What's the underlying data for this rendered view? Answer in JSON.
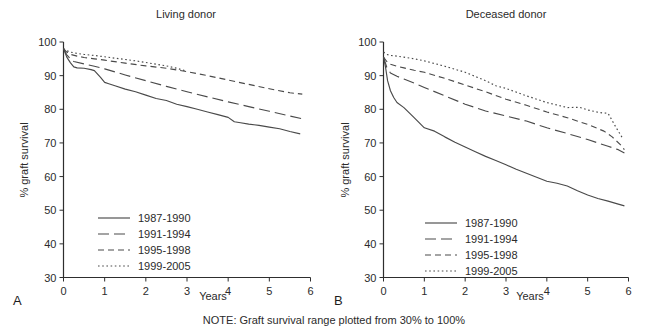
{
  "figure": {
    "note": "NOTE: Graft survival range plotted from 30% to 100%",
    "y_axis_title": "% graft survival",
    "x_axis_title": "Years"
  },
  "panels": [
    {
      "letter": "A",
      "title": "Living donor",
      "legend": [
        {
          "label": "1987-1990",
          "style": "solid"
        },
        {
          "label": "1991-1994",
          "style": "longdash"
        },
        {
          "label": "1995-1998",
          "style": "dash"
        },
        {
          "label": "1999-2005",
          "style": "dot"
        }
      ]
    },
    {
      "letter": "B",
      "title": "Deceased donor",
      "legend": [
        {
          "label": "1987-1990",
          "style": "solid"
        },
        {
          "label": "1991-1994",
          "style": "longdash"
        },
        {
          "label": "1995-1998",
          "style": "dash"
        },
        {
          "label": "1999-2005",
          "style": "dot"
        }
      ]
    }
  ],
  "axes": {
    "y_ticks": [
      "100",
      "90",
      "80",
      "70",
      "60",
      "50",
      "40",
      "30"
    ],
    "x_ticks": [
      "0",
      "1",
      "2",
      "3",
      "4",
      "5",
      "6"
    ]
  },
  "chart_data": {
    "type": "line",
    "subtitle": "NOTE: Graft survival range plotted from 30% to 100%",
    "xlabel": "Years",
    "ylabel": "% graft survival",
    "xlim": [
      0,
      6
    ],
    "ylim": [
      30,
      100
    ],
    "grid": false,
    "legend_position": "lower-left-inside",
    "panels": [
      {
        "panel": "A",
        "title": "Living donor",
        "series": [
          {
            "name": "1987-1990",
            "style": "solid",
            "x": [
              0,
              0.08,
              0.17,
              0.25,
              0.33,
              0.5,
              0.67,
              0.75,
              0.9,
              1.0,
              1.1,
              1.25,
              1.5,
              1.75,
              2.0,
              2.25,
              2.5,
              2.75,
              3.0,
              3.25,
              3.5,
              3.75,
              4.0,
              4.15,
              4.3,
              4.5,
              4.75,
              5.0,
              5.25,
              5.5,
              5.75
            ],
            "y": [
              98.0,
              95.5,
              93.8,
              92.6,
              92.3,
              92.2,
              91.8,
              91.5,
              89.5,
              88.0,
              87.6,
              87.0,
              86.0,
              85.2,
              84.2,
              83.2,
              82.6,
              81.5,
              80.8,
              80.0,
              79.2,
              78.4,
              77.6,
              76.3,
              76.0,
              75.6,
              75.2,
              74.7,
              74.2,
              73.4,
              72.7
            ]
          },
          {
            "name": "1991-1994",
            "style": "longdash",
            "x": [
              0,
              0.08,
              0.17,
              0.25,
              0.5,
              0.75,
              1.0,
              1.5,
              2.0,
              2.5,
              3.0,
              3.5,
              4.0,
              4.5,
              5.0,
              5.5,
              5.8
            ],
            "y": [
              98.0,
              96.2,
              95.0,
              94.2,
              93.5,
              92.8,
              92.0,
              90.2,
              88.5,
              86.8,
              85.2,
              83.7,
              82.2,
              80.8,
              79.4,
              78.0,
              77.2
            ]
          },
          {
            "name": "1995-1998",
            "style": "dash",
            "x": [
              0,
              0.08,
              0.17,
              0.33,
              0.5,
              0.75,
              1.0,
              1.5,
              2.0,
              2.5,
              3.0,
              3.5,
              4.0,
              4.5,
              5.0,
              5.5,
              5.8
            ],
            "y": [
              98.0,
              97.0,
              96.3,
              95.8,
              95.4,
              95.0,
              94.6,
              93.7,
              92.9,
              92.2,
              91.2,
              90.0,
              88.7,
              87.4,
              86.1,
              84.9,
              84.5
            ]
          },
          {
            "name": "1999-2005",
            "style": "dot",
            "x": [
              0,
              0.08,
              0.17,
              0.33,
              0.5,
              0.75,
              1.0,
              1.25,
              1.5,
              1.75,
              2.0,
              2.25,
              2.5,
              2.75,
              3.0
            ],
            "y": [
              98.0,
              97.4,
              97.0,
              96.6,
              96.3,
              96.0,
              95.6,
              95.2,
              94.8,
              94.4,
              93.9,
              93.4,
              92.9,
              92.2,
              91.3
            ]
          }
        ]
      },
      {
        "panel": "B",
        "title": "Deceased donor",
        "series": [
          {
            "name": "1987-1990",
            "style": "solid",
            "x": [
              0,
              0.05,
              0.1,
              0.17,
              0.25,
              0.33,
              0.5,
              0.75,
              1.0,
              1.25,
              1.5,
              1.75,
              2.0,
              2.25,
              2.5,
              2.75,
              3.0,
              3.25,
              3.5,
              3.75,
              4.0,
              4.25,
              4.5,
              4.75,
              5.0,
              5.25,
              5.5,
              5.75,
              5.9
            ],
            "y": [
              95.5,
              92.5,
              88.5,
              85.5,
              83.5,
              82.0,
              80.5,
              77.5,
              74.5,
              73.5,
              71.8,
              70.2,
              68.8,
              67.4,
              66.0,
              64.8,
              63.5,
              62.2,
              61.0,
              59.8,
              58.6,
              58.0,
              57.2,
              55.8,
              54.5,
              53.5,
              52.7,
              51.8,
              51.3
            ]
          },
          {
            "name": "1991-1994",
            "style": "longdash",
            "x": [
              0,
              0.08,
              0.17,
              0.33,
              0.5,
              0.75,
              1.0,
              1.5,
              2.0,
              2.5,
              3.0,
              3.5,
              4.0,
              4.5,
              5.0,
              5.5,
              5.75,
              5.9
            ],
            "y": [
              95.5,
              92.5,
              90.8,
              89.8,
              89.0,
              87.8,
              86.5,
              84.0,
              81.5,
              79.5,
              78.0,
              76.5,
              74.5,
              72.8,
              71.0,
              69.0,
              68.0,
              67.0
            ]
          },
          {
            "name": "1995-1998",
            "style": "dash",
            "x": [
              0,
              0.08,
              0.17,
              0.33,
              0.5,
              0.75,
              1.0,
              1.5,
              2.0,
              2.5,
              3.0,
              3.5,
              4.0,
              4.5,
              5.0,
              5.4,
              5.6,
              5.8,
              5.9
            ],
            "y": [
              95.5,
              94.2,
              93.4,
              92.8,
              92.3,
              91.6,
              91.0,
              89.2,
              87.2,
              85.2,
              83.0,
              81.2,
              79.2,
              77.5,
              75.5,
              73.5,
              71.8,
              69.5,
              68.0
            ]
          },
          {
            "name": "1999-2005",
            "style": "dot",
            "x": [
              0,
              0.08,
              0.17,
              0.33,
              0.5,
              0.75,
              1.0,
              1.5,
              2.0,
              2.5,
              2.75,
              3.0,
              3.5,
              4.0,
              4.5,
              4.8,
              5.0,
              5.3,
              5.5,
              5.7,
              5.85
            ],
            "y": [
              97.0,
              96.3,
              96.0,
              95.8,
              95.5,
              95.0,
              94.4,
              92.8,
              91.0,
              88.5,
              87.0,
              86.2,
              84.0,
              82.0,
              80.5,
              80.6,
              79.8,
              79.0,
              78.8,
              74.5,
              71.5
            ]
          }
        ]
      }
    ]
  }
}
